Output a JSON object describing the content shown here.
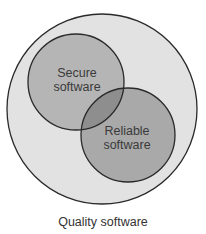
{
  "diagram": {
    "type": "venn",
    "caption": "Quality software",
    "outer": {
      "label": "Quality software",
      "fill": "#e2e2e2",
      "stroke": "#2a2a2a"
    },
    "sets": [
      {
        "id": "secure",
        "line1": "Secure",
        "line2": "software",
        "fill": "#b5b5b5"
      },
      {
        "id": "reliable",
        "line1": "Reliable",
        "line2": "software",
        "fill": "#a9a9a9"
      }
    ],
    "overlap_fill": "#8e8e8e"
  }
}
